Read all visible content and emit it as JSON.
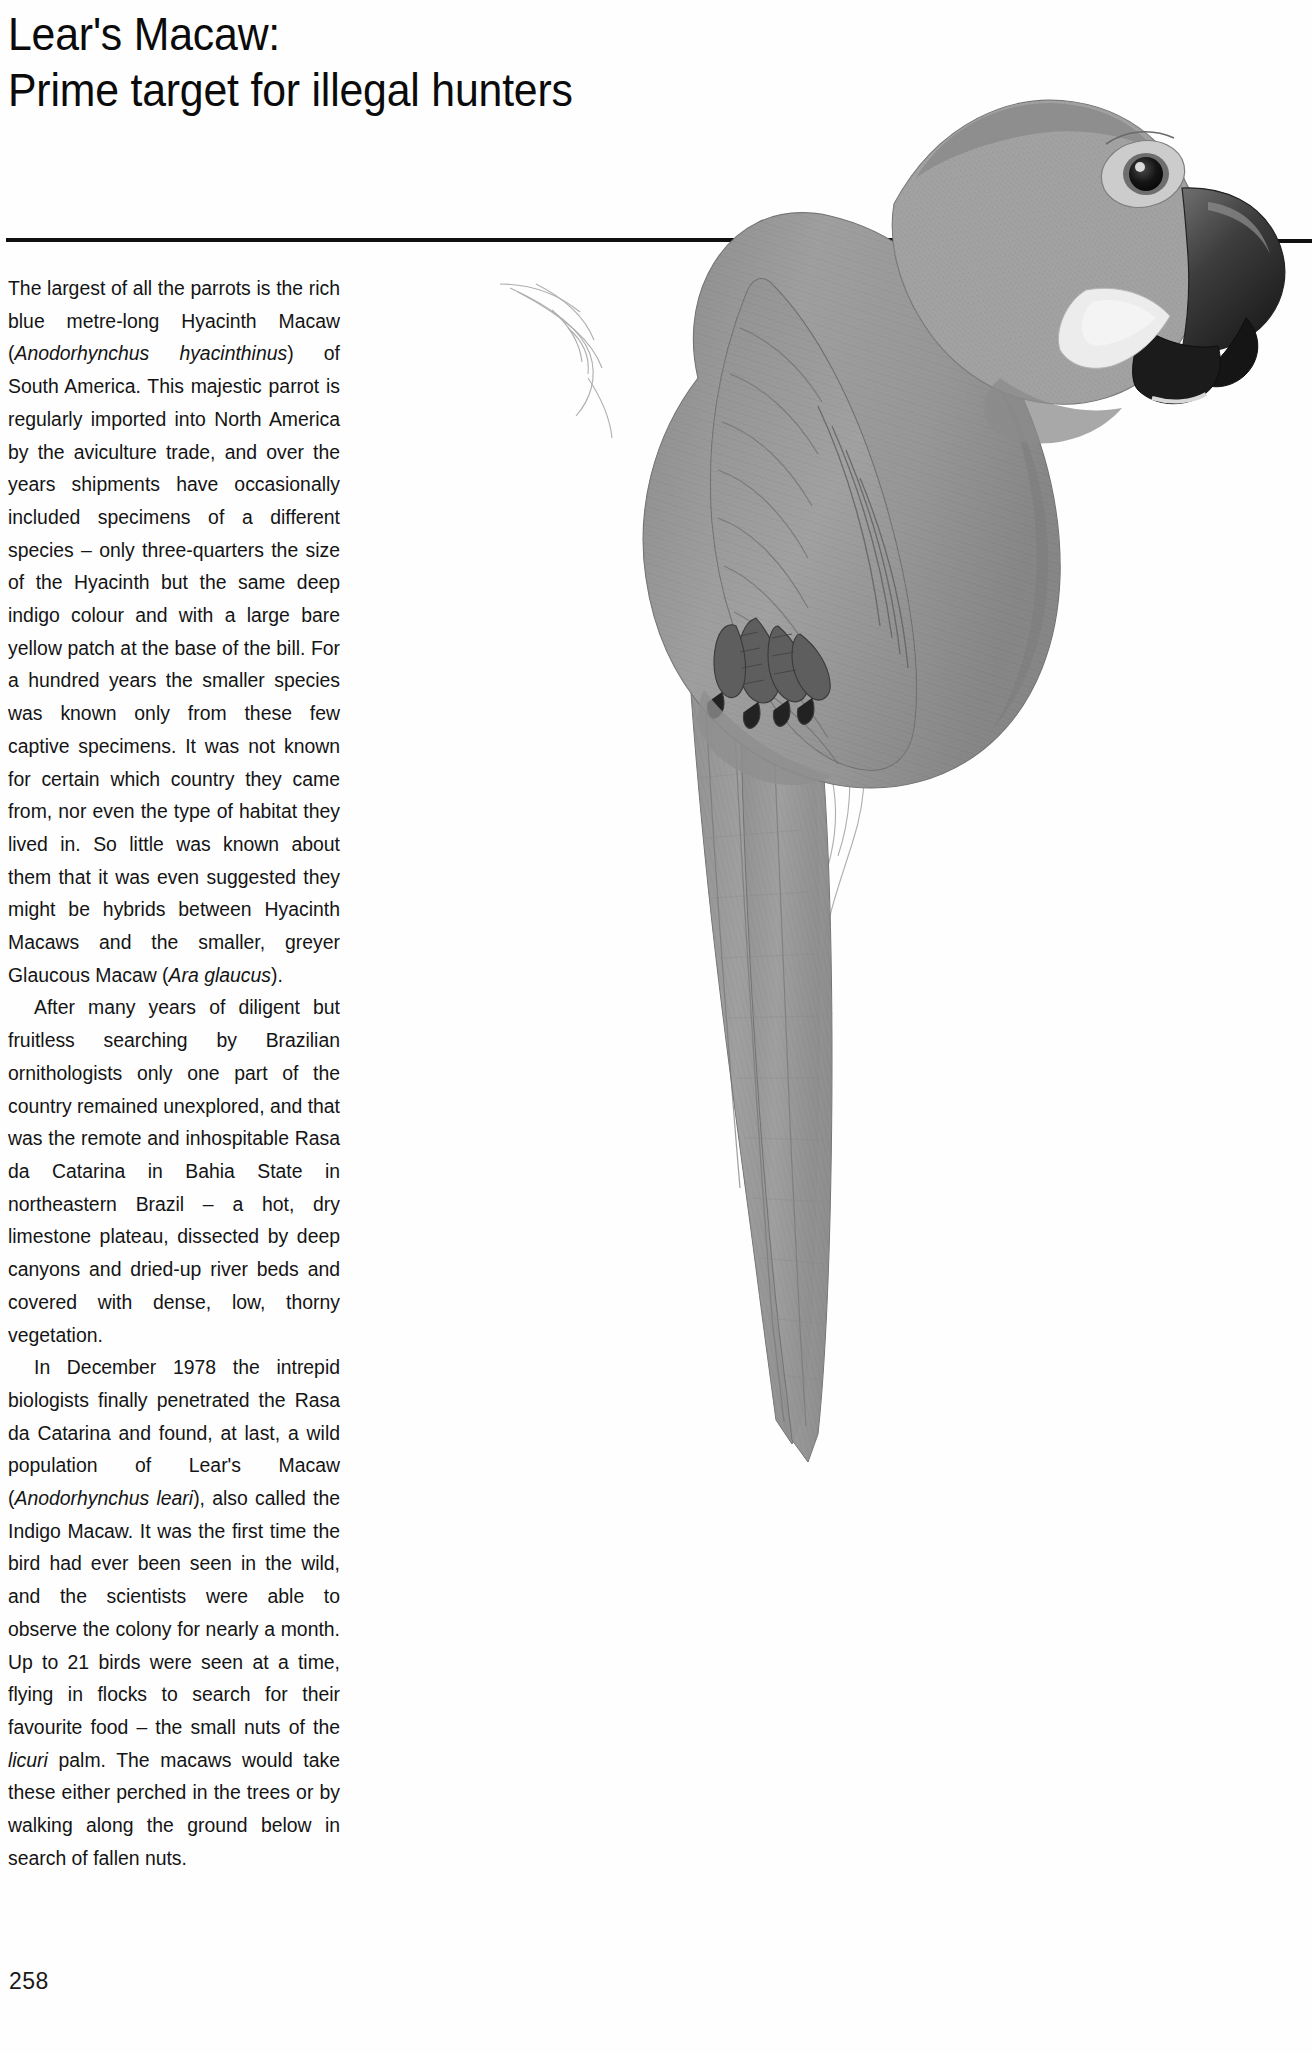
{
  "document": {
    "type": "book-page-scan",
    "page_number": "258",
    "title_lines": [
      "Lear's Macaw:",
      "Prime target for illegal hunters"
    ],
    "rule_color": "#101010",
    "background_color": "#ffffff",
    "text_color": "#141414"
  },
  "body": {
    "paragraphs": [
      {
        "id": "p1",
        "indent": false,
        "html": "The largest of all the parrots is the rich blue metre-long Hyacinth Macaw (<i>Anodorhynchus hyacinthinus</i>) of South America. This majestic parrot is regularly imported into North America by the aviculture trade, and over the years shipments have occasionally included specimens of a different species &ndash; only three-quarters the size of the Hyacinth but the same deep indigo colour and with a large bare yellow patch at the base of the bill. For a hundred years the smaller species was known only from these few captive specimens. It was not known for certain which country they came from, nor even the type of habitat they lived in. So little was known about them that it was even suggested they might be hybrids between Hyacinth Macaws and the smaller, greyer Glaucous Macaw (<i>Ara glaucus</i>)."
      },
      {
        "id": "p2",
        "indent": true,
        "html": "After many years of diligent but fruitless searching by Brazilian ornithologists only one part of the country remained unexplored, and that was the remote and inhospitable Rasa da Catarina in Bahia State in northeastern Brazil &ndash; a hot, dry limestone plateau, dissected by deep canyons and dried-up river beds and covered with dense, low, thorny vegetation."
      },
      {
        "id": "p3",
        "indent": true,
        "html": "In December 1978 the intrepid biologists finally penetrated the Rasa da Catarina and found, at last, a wild population of Lear's Macaw (<i>Anodorhynchus leari</i>), also called the Indigo Macaw. It was the first time the bird had ever been seen in the wild, and the scientists were able to observe the colony for nearly a month. Up to 21 birds were seen at a time, flying in flocks to search for their favourite food &ndash; the small nuts of the <i>licuri</i> palm. The macaws would take these either perched in the trees or by walking along the ground below in search of fallen nuts."
      }
    ]
  },
  "illustration": {
    "subject": "Lear's Macaw perched on a branch",
    "medium": "graphite pencil drawing, greyscale",
    "caption": "",
    "features": [
      "large blue-grey parrot in profile facing right",
      "dark hooked beak with pale yellow bare patch at base of lower mandible",
      "pale bare eye-ring with dark iris",
      "very long tapering tail extending to lower portion of page",
      "scaly feet gripping a lightly sketched rocky branch"
    ],
    "tones": {
      "body_light": "#b6b6b6",
      "body_mid": "#8e8e8e",
      "body_dark": "#6a6a6a",
      "beak_dark": "#2e2e2e",
      "patch_pale": "#ececec",
      "branch_line": "#9a9a9a"
    }
  }
}
